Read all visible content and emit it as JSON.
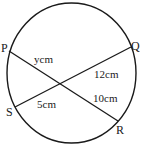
{
  "figure": {
    "type": "circle-intersecting-chords",
    "circle": {
      "cx": 71.5,
      "cy": 73,
      "rx": 64.5,
      "ry": 70,
      "stroke": "#1a1a1a"
    },
    "points": {
      "P": {
        "label": "P",
        "x": 9,
        "y": 51
      },
      "Q": {
        "label": "Q",
        "x": 131,
        "y": 47
      },
      "S": {
        "label": "S",
        "x": 15,
        "y": 107
      },
      "R": {
        "label": "R",
        "x": 118,
        "y": 121
      }
    },
    "intersection": {
      "x": 61,
      "y": 83
    },
    "chords": [
      {
        "from": "P",
        "to": "R"
      },
      {
        "from": "S",
        "to": "Q"
      }
    ],
    "lengths": {
      "PX": "ycm",
      "XQ": "12cm",
      "XR": "10cm",
      "SX": "5cm"
    }
  }
}
